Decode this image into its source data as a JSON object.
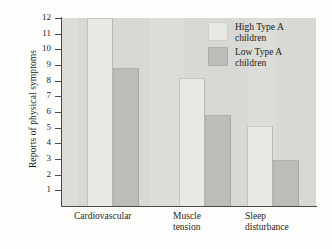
{
  "chart_data": {
    "type": "bar",
    "title": "",
    "xlabel": "",
    "ylabel": "Reports of physical symptoms",
    "categories": [
      "Cardiovascular",
      "Muscle tension",
      "Sleep disturbance"
    ],
    "series": [
      {
        "name": "High Type A children",
        "values": [
          12,
          8.2,
          5.1
        ],
        "color": "#e8e8e4"
      },
      {
        "name": "Low Type A children",
        "values": [
          8.8,
          5.8,
          2.95
        ],
        "color": "#bcbcb8"
      }
    ],
    "ylim": [
      0,
      12
    ],
    "yticks": [
      1,
      2,
      3,
      4,
      5,
      6,
      7,
      8,
      9,
      10,
      11,
      12
    ],
    "ytick_labels": [
      "1",
      "2",
      "3",
      "4",
      "5",
      "6",
      "7",
      "8",
      "9",
      "10",
      "11",
      "12"
    ],
    "grid": false,
    "legend_position": "top-right",
    "plot_background": "#d8d8d4"
  },
  "axis": {
    "y_title": "Reports of physical symptoms",
    "ticks": [
      "12",
      "11",
      "10",
      "9",
      "8",
      "7",
      "6",
      "5",
      "4",
      "3",
      "2",
      "1"
    ]
  },
  "categories": [
    {
      "line1": "Cardiovascular",
      "line2": ""
    },
    {
      "line1": "Muscle",
      "line2": "tension"
    },
    {
      "line1": "Sleep",
      "line2": "disturbance"
    }
  ],
  "legend": {
    "items": [
      {
        "label": "High Type A\nchildren",
        "swatch": "high-type-a-swatch"
      },
      {
        "label": "Low Type A\nchildren",
        "swatch": "low-type-a-swatch"
      }
    ]
  }
}
